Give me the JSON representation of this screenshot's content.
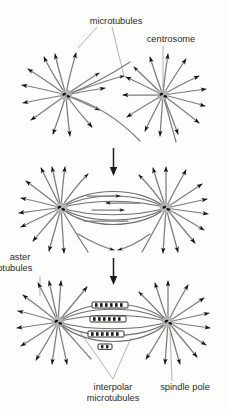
{
  "figure": {
    "background_color": "#fdfdfc",
    "width": 227,
    "height": 415,
    "microtubule_color": "#7c7c7c",
    "arrowhead_color": "#111111",
    "centrosome_color": "#b2b2b2",
    "centriole_color": "#101010",
    "label_color": "#2b2b2b",
    "leader_color": "#8a8a8a"
  },
  "labels": {
    "microtubules": "microtubules",
    "centrosome": "centrosome",
    "aster_line1": "aster",
    "aster_line2": "microtubules",
    "interpolar_line1": "interpolar",
    "interpolar_line2": "microtubules",
    "spindle_pole": "spindle pole"
  },
  "stages": [
    {
      "name": "stage-1-separating-asters",
      "description": "Two separate asters with radiating microtubules"
    },
    {
      "name": "stage-2-interacting-asters",
      "description": "Asters approach and interpolar microtubules overlap"
    },
    {
      "name": "stage-3-bipolar-spindle",
      "description": "Bipolar spindle with chromosomes aligned between poles"
    }
  ],
  "transitions": [
    {
      "name": "transition-arrow-1",
      "glyph": "down-arrow"
    },
    {
      "name": "transition-arrow-2",
      "glyph": "down-arrow"
    }
  ],
  "chromosomes": {
    "count": 4,
    "description": "Ladder-banded chromosome segments between spindle poles"
  }
}
